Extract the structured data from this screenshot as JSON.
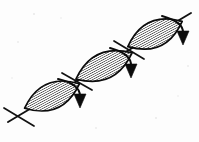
{
  "figure": {
    "background_color": "#fdfdfd",
    "ink_color": "#0b0b0b",
    "width": 199,
    "height": 142,
    "axis": {
      "name": "main-diagonal-axis",
      "x1": 8,
      "y1": 122,
      "x2": 191,
      "y2": 13,
      "stroke_width": 1.9,
      "description": "long straight line running from lower-left to upper-right through all three lobes"
    },
    "lobes": [
      {
        "id": "lobe-1",
        "label": "lower-left lobe",
        "center_x": 52,
        "center_y": 96,
        "semi_major": 30,
        "semi_minor": 13,
        "rotation_deg": -24,
        "hatch": "diagonal",
        "hatch_angle_deg": 62,
        "hatch_spacing": 2.1
      },
      {
        "id": "lobe-2",
        "label": "middle lobe",
        "center_x": 104,
        "center_y": 66,
        "semi_major": 31,
        "semi_minor": 13,
        "rotation_deg": -25,
        "hatch": "diagonal",
        "hatch_angle_deg": 62,
        "hatch_spacing": 2.1
      },
      {
        "id": "lobe-3",
        "label": "upper-right lobe",
        "center_x": 155,
        "center_y": 34,
        "semi_major": 30,
        "semi_minor": 13,
        "rotation_deg": -25,
        "hatch": "diagonal",
        "hatch_angle_deg": 62,
        "hatch_spacing": 2.1
      }
    ],
    "nodes": [
      {
        "id": "node-1",
        "label": "lower-left crossing segment",
        "x1": 4,
        "y1": 108,
        "x2": 34,
        "y2": 126
      },
      {
        "id": "node-2",
        "label": "first middle crossing segment",
        "x1": 62,
        "y1": 73,
        "x2": 92,
        "y2": 90
      },
      {
        "id": "node-3",
        "label": "second middle crossing segment",
        "x1": 114,
        "y1": 41,
        "x2": 144,
        "y2": 59
      }
    ],
    "arrows": [
      {
        "id": "arrow-1",
        "label": "lower-left rotation arrow",
        "arc_start_x": 58,
        "arc_start_y": 79,
        "arc_ctrl_x": 80,
        "arc_ctrl_y": 84,
        "arc_end_x": 80,
        "arc_end_y": 96,
        "tip_x": 80,
        "tip_y": 108,
        "direction": "down-right"
      },
      {
        "id": "arrow-2",
        "label": "middle rotation arrow",
        "arc_start_x": 110,
        "arc_start_y": 48,
        "arc_ctrl_x": 132,
        "arc_ctrl_y": 54,
        "arc_end_x": 131,
        "arc_end_y": 66,
        "tip_x": 131,
        "tip_y": 78,
        "direction": "down-right"
      },
      {
        "id": "arrow-3",
        "label": "upper-right rotation arrow",
        "arc_start_x": 162,
        "arc_start_y": 16,
        "arc_ctrl_x": 184,
        "arc_ctrl_y": 22,
        "arc_end_x": 183,
        "arc_end_y": 33,
        "tip_x": 183,
        "tip_y": 45,
        "direction": "down-right"
      }
    ],
    "arrow_head": {
      "half_width": 6.0,
      "length": 14.0
    }
  }
}
